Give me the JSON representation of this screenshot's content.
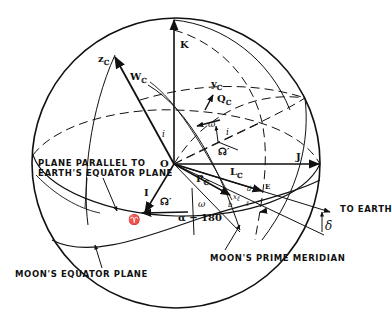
{
  "figure": {
    "axes": {
      "K": "K",
      "J": "J",
      "I": "I",
      "z": "z",
      "z_sub": "ℂ",
      "y": "y",
      "y_sub": "ℂ"
    },
    "vectors": {
      "W": "W",
      "W_sub": "ℂ",
      "Q": "Q",
      "Q_sub": "ℂ",
      "P": "P",
      "P_sub": "ℂ",
      "L": "L",
      "L_sub": "ℂ"
    },
    "points": {
      "origin": "O",
      "earth_dir": "E",
      "vernal_equinox": "♈"
    },
    "angles": {
      "inclination_upper": "i",
      "inclination_lower": "i",
      "node_upper": "☊",
      "node_upper_prime": "′",
      "node_lower": "☊",
      "node_lower_prime": "′",
      "omega_upper": "ω",
      "omega_lower": "ω",
      "small_i": "i",
      "alpha_minus_180": "α − 180",
      "delta": "δ",
      "d": "d",
      "b": "b",
      "l": "ℓ",
      "x_l": "x",
      "x_l_sub": "ℓ"
    },
    "annotations": {
      "plane_parallel_line1": "PLANE PARALLEL TO",
      "plane_parallel_line2": "EARTH'S EQUATOR PLANE",
      "moons_equator": "MOON'S EQUATOR PLANE",
      "prime_meridian": "MOON'S PRIME MERIDIAN",
      "to_earth": "TO EARTH"
    },
    "colors": {
      "ink": "#111111",
      "background": "#ffffff"
    }
  }
}
